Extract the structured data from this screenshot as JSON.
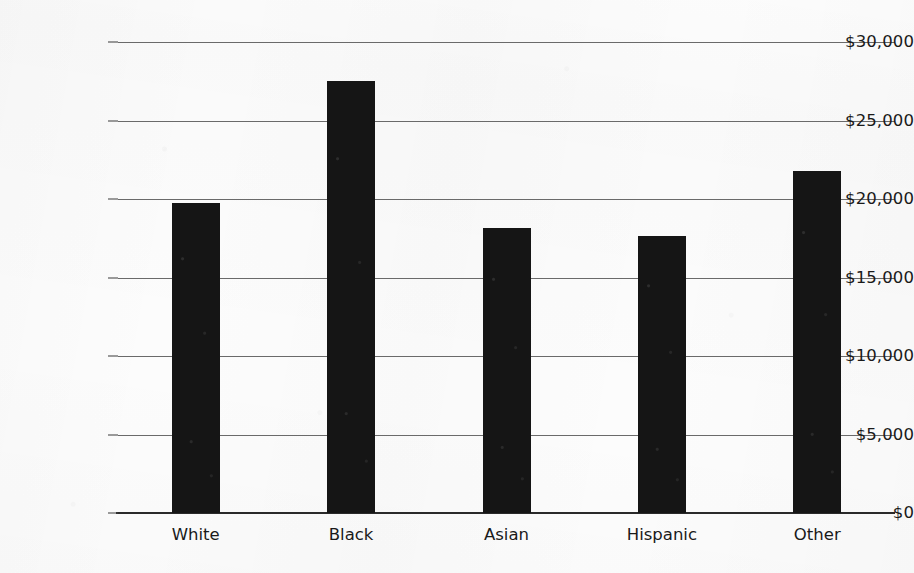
{
  "chart_data": {
    "type": "bar",
    "title": "",
    "subtitle": "",
    "xlabel": "",
    "ylabel": "",
    "categories": [
      "White",
      "Black",
      "Asian",
      "Hispanic",
      "Other"
    ],
    "values": [
      19750,
      27500,
      18150,
      17650,
      21800
    ],
    "ylim": [
      0,
      30000
    ],
    "ytick_values": [
      0,
      5000,
      10000,
      15000,
      20000,
      25000,
      30000
    ],
    "ytick_labels": [
      "$0",
      "$5,000",
      "$10,000",
      "$15,000",
      "$20,000",
      "$25,000",
      "$30,000"
    ],
    "grid": true,
    "legend": null,
    "legend_position": "none",
    "bar_color": "#151515",
    "gridline_color": "#6a6a6a",
    "axis_color": "#2a2a2a",
    "background_color": "#fcfcfc",
    "text_color": "#1a1a1a",
    "annotations": []
  }
}
